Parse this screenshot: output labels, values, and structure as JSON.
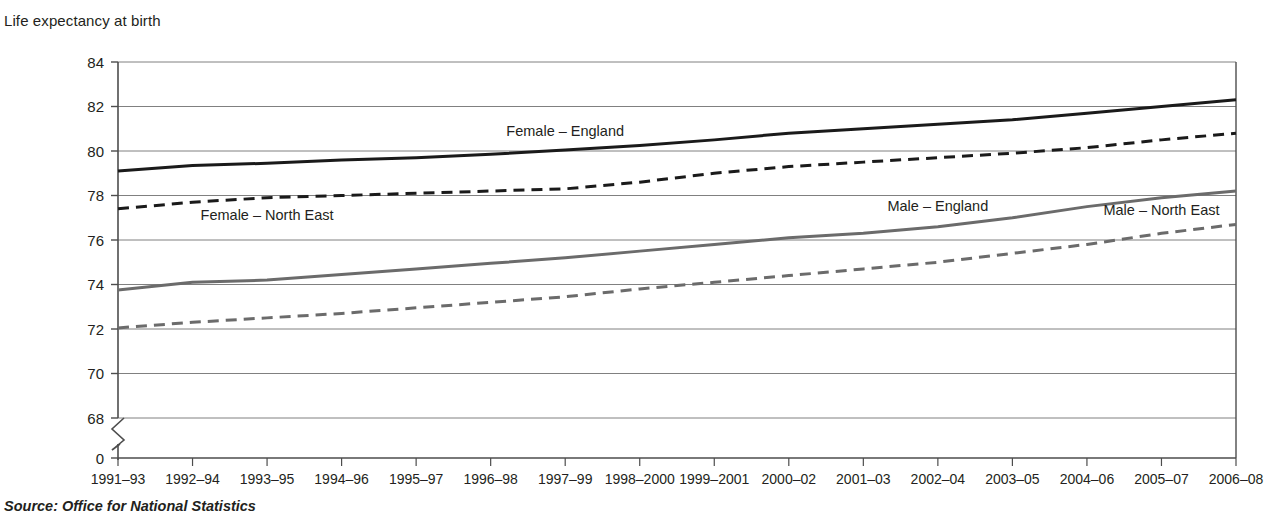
{
  "header": {
    "axis_title": "Life expectancy at birth"
  },
  "footer": {
    "source": "Source: Office for National Statistics"
  },
  "colors": {
    "female_series": "#1a1a1a",
    "male_series": "#6b6b6b",
    "gridline": "#808080",
    "axis": "#4d4d4d",
    "text": "#231f20",
    "background": "#ffffff"
  },
  "chart_data": {
    "type": "line",
    "title": "Life expectancy at birth",
    "xlabel": "",
    "ylabel": "Life expectancy at birth",
    "ylim": [
      68,
      84
    ],
    "y_axis_break": true,
    "y_break_base_label": "0",
    "yticks": [
      68,
      70,
      72,
      74,
      76,
      78,
      80,
      82,
      84
    ],
    "ytick_labels": [
      "68",
      "70",
      "72",
      "74",
      "76",
      "78",
      "80",
      "82",
      "84"
    ],
    "grid": true,
    "legend_position": "inline-labels",
    "categories": [
      "1991–93",
      "1992–94",
      "1993–95",
      "1994–96",
      "1995–97",
      "1996–98",
      "1997–99",
      "1998–2000",
      "1999–2001",
      "2000–02",
      "2001–03",
      "2002–04",
      "2003–05",
      "2004–06",
      "2005–07",
      "2006–08"
    ],
    "series": [
      {
        "name": "Female – England",
        "style": "solid",
        "color": "#1a1a1a",
        "width": 3,
        "label_x_index": 6,
        "label_dy": -14,
        "values": [
          79.1,
          79.35,
          79.45,
          79.6,
          79.7,
          79.85,
          80.05,
          80.25,
          80.5,
          80.8,
          81.0,
          81.2,
          81.4,
          81.7,
          82.0,
          82.3
        ]
      },
      {
        "name": "Female – North East",
        "style": "dashed",
        "color": "#1a1a1a",
        "width": 3,
        "label_x_index": 2,
        "label_dy": 22,
        "values": [
          77.4,
          77.7,
          77.9,
          78.0,
          78.1,
          78.2,
          78.3,
          78.6,
          79.0,
          79.3,
          79.5,
          79.7,
          79.9,
          80.15,
          80.5,
          80.8
        ]
      },
      {
        "name": "Male – England",
        "style": "solid",
        "color": "#6b6b6b",
        "width": 3,
        "label_x_index": 11,
        "label_dy": -16,
        "values": [
          73.75,
          74.1,
          74.2,
          74.45,
          74.7,
          74.95,
          75.2,
          75.5,
          75.8,
          76.1,
          76.3,
          76.6,
          77.0,
          77.5,
          77.9,
          78.2
        ]
      },
      {
        "name": "Male – North East",
        "style": "dashed",
        "color": "#6b6b6b",
        "width": 3,
        "label_x_index": 14,
        "label_dy": -18,
        "values": [
          72.05,
          72.3,
          72.5,
          72.7,
          72.95,
          73.2,
          73.45,
          73.8,
          74.1,
          74.4,
          74.7,
          75.0,
          75.4,
          75.8,
          76.3,
          76.7
        ]
      }
    ]
  }
}
